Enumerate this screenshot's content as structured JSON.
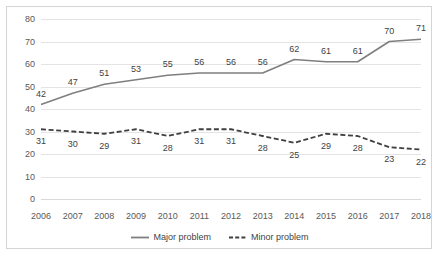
{
  "chart_data": {
    "type": "line",
    "title": "",
    "xlabel": "",
    "ylabel": "",
    "categories": [
      "2006",
      "2007",
      "2008",
      "2009",
      "2010",
      "2011",
      "2012",
      "2013",
      "2014",
      "2015",
      "2016",
      "2017",
      "2018"
    ],
    "series": [
      {
        "name": "Major problem",
        "style": "solid",
        "color": "#7f7f7f",
        "values": [
          42,
          47,
          51,
          53,
          55,
          56,
          56,
          56,
          62,
          61,
          61,
          70,
          71
        ]
      },
      {
        "name": "Minor problem",
        "style": "dashed",
        "color": "#404040",
        "values": [
          31,
          30,
          29,
          31,
          28,
          31,
          31,
          28,
          25,
          29,
          28,
          23,
          22
        ]
      }
    ],
    "ylim": [
      0,
      80
    ],
    "ytick_step": 10,
    "yticks": [
      "0",
      "10",
      "20",
      "30",
      "40",
      "50",
      "60",
      "70",
      "80"
    ],
    "grid": true,
    "legend_position": "bottom-center",
    "data_labels": true
  },
  "axis": {
    "y_ticks": [
      "80",
      "70",
      "60",
      "50",
      "40",
      "30",
      "20",
      "10",
      "0"
    ],
    "x_ticks": [
      "2006",
      "2007",
      "2008",
      "2009",
      "2010",
      "2011",
      "2012",
      "2013",
      "2014",
      "2015",
      "2016",
      "2017",
      "2018"
    ]
  },
  "legend": {
    "items": [
      {
        "label": "Major problem"
      },
      {
        "label": "Minor problem"
      }
    ]
  },
  "colors": {
    "major_line": "#7f7f7f",
    "minor_line": "#404040",
    "gridline": "#e4e4e4",
    "axis_text": "#595959",
    "label_text": "#3f3f3f",
    "frame_border": "#d4d4d4",
    "background": "#ffffff"
  }
}
